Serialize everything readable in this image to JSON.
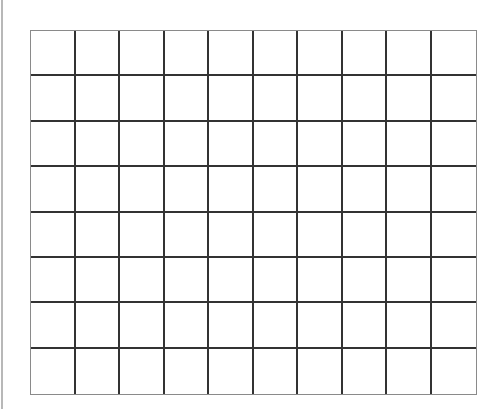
{
  "grid": {
    "columns": 10,
    "rows": 8,
    "line_color": "#333333",
    "border_color": "#8a8a8a",
    "cell_fill": "#ffffff"
  },
  "panel": {
    "left_edge_color": "#b8b8b8"
  }
}
